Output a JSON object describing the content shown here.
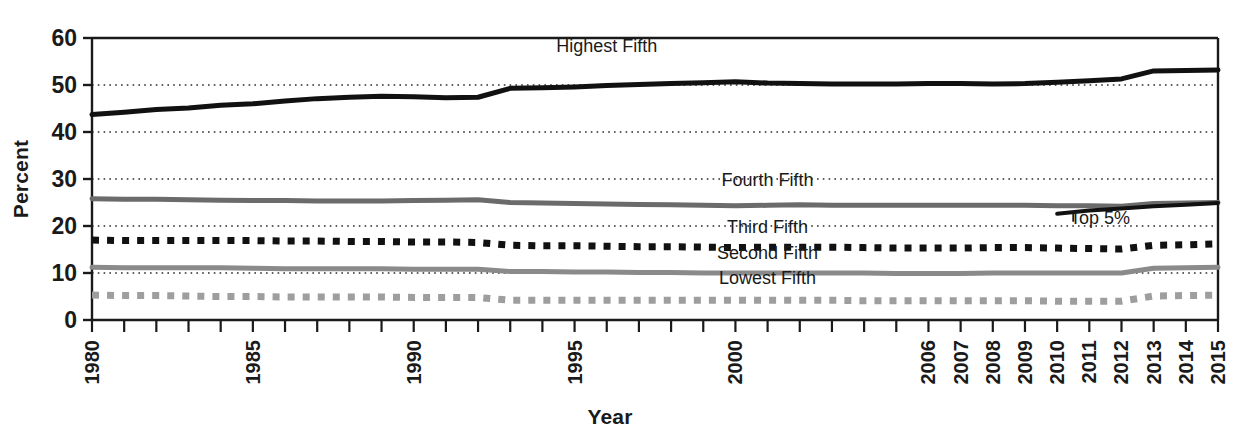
{
  "chart_data": {
    "type": "line",
    "title": "",
    "xlabel": "Year",
    "ylabel": "Percent",
    "ylim": [
      0,
      60
    ],
    "yticks": [
      0,
      10,
      20,
      30,
      40,
      50,
      60
    ],
    "grid": "horizontal-dotted",
    "legend_position": "inline-labels",
    "xlim": [
      1980,
      2015
    ],
    "xticks": [
      1980,
      1981,
      1982,
      1983,
      1984,
      1985,
      1986,
      1987,
      1988,
      1989,
      1990,
      1991,
      1992,
      1993,
      1994,
      1995,
      1996,
      1997,
      1998,
      1999,
      2000,
      2001,
      2002,
      2003,
      2004,
      2005,
      2006,
      2007,
      2008,
      2009,
      2010,
      2011,
      2012,
      2013,
      2014,
      2015
    ],
    "xticklabels": [
      "1980",
      "",
      "",
      "",
      "",
      "1985",
      "",
      "",
      "",
      "",
      "1990",
      "",
      "",
      "",
      "",
      "1995",
      "",
      "",
      "",
      "",
      "2000",
      "",
      "",
      "",
      "",
      "",
      "2006",
      "2007",
      "2008",
      "2009",
      "2010",
      "2011",
      "2012",
      "2013",
      "2014",
      "2015"
    ],
    "x": [
      1980,
      1981,
      1982,
      1983,
      1984,
      1985,
      1986,
      1987,
      1988,
      1989,
      1990,
      1991,
      1992,
      1993,
      1994,
      1995,
      1996,
      1997,
      1998,
      1999,
      2000,
      2001,
      2002,
      2003,
      2004,
      2005,
      2006,
      2007,
      2008,
      2009,
      2010,
      2011,
      2012,
      2013,
      2014,
      2015
    ],
    "series": [
      {
        "name": "Highest Fifth",
        "style": "solid",
        "color": "#111111",
        "width": 5,
        "label_x": 1996,
        "label_y": 57,
        "values": [
          43.7,
          44.2,
          44.8,
          45.1,
          45.7,
          46.0,
          46.6,
          47.1,
          47.4,
          47.6,
          47.5,
          47.3,
          47.4,
          49.3,
          49.4,
          49.6,
          49.9,
          50.1,
          50.3,
          50.5,
          50.7,
          50.4,
          50.3,
          50.2,
          50.2,
          50.2,
          50.3,
          50.3,
          50.2,
          50.3,
          50.6,
          50.9,
          51.3,
          53.0,
          53.1,
          53.2
        ]
      },
      {
        "name": "Fourth Fifth",
        "style": "solid",
        "color": "#6b6b6b",
        "width": 5,
        "label_x": 2001,
        "label_y": 28.5,
        "values": [
          25.8,
          25.7,
          25.7,
          25.6,
          25.5,
          25.4,
          25.4,
          25.3,
          25.3,
          25.3,
          25.4,
          25.5,
          25.6,
          25.0,
          24.9,
          24.8,
          24.7,
          24.6,
          24.5,
          24.4,
          24.3,
          24.4,
          24.5,
          24.4,
          24.4,
          24.4,
          24.4,
          24.4,
          24.4,
          24.4,
          24.3,
          24.3,
          24.2,
          24.8,
          24.9,
          25.0
        ]
      },
      {
        "name": "Top 5%",
        "style": "solid",
        "color": "#111111",
        "width": 4,
        "label_x": 2010.4,
        "label_y": 20.4,
        "start_year": 2010,
        "values": [
          null,
          null,
          null,
          null,
          null,
          null,
          null,
          null,
          null,
          null,
          null,
          null,
          null,
          null,
          null,
          null,
          null,
          null,
          null,
          null,
          null,
          null,
          null,
          null,
          null,
          null,
          null,
          null,
          null,
          null,
          22.6,
          23.3,
          23.7,
          24.2,
          24.5,
          24.9
        ]
      },
      {
        "name": "Third Fifth",
        "style": "dashed",
        "color": "#111111",
        "width": 7,
        "label_x": 2001,
        "label_y": 18.6,
        "values": [
          17.0,
          16.9,
          16.9,
          16.9,
          16.9,
          16.9,
          16.8,
          16.8,
          16.7,
          16.7,
          16.6,
          16.6,
          16.5,
          15.9,
          15.8,
          15.8,
          15.7,
          15.6,
          15.6,
          15.5,
          15.4,
          15.5,
          15.5,
          15.5,
          15.4,
          15.3,
          15.3,
          15.3,
          15.4,
          15.4,
          15.3,
          15.2,
          15.1,
          15.9,
          16.0,
          16.2
        ]
      },
      {
        "name": "Second Fifth",
        "style": "solid",
        "color": "#8a8a8a",
        "width": 5,
        "label_x": 2001,
        "label_y": 13.0,
        "values": [
          11.2,
          11.1,
          11.1,
          11.1,
          11.1,
          11.0,
          10.9,
          10.9,
          10.9,
          10.9,
          10.8,
          10.8,
          10.8,
          10.3,
          10.3,
          10.2,
          10.2,
          10.1,
          10.1,
          10.0,
          10.0,
          10.0,
          10.0,
          10.0,
          10.0,
          9.9,
          9.9,
          9.9,
          10.0,
          10.0,
          10.0,
          10.0,
          10.0,
          11.0,
          11.1,
          11.2
        ]
      },
      {
        "name": "Lowest Fifth",
        "style": "dashed",
        "color": "#9e9e9e",
        "width": 7,
        "label_x": 2001,
        "label_y": 7.6,
        "values": [
          5.3,
          5.2,
          5.2,
          5.1,
          5.0,
          5.0,
          4.9,
          4.9,
          4.9,
          4.9,
          4.8,
          4.8,
          4.8,
          4.2,
          4.2,
          4.2,
          4.2,
          4.2,
          4.2,
          4.2,
          4.2,
          4.2,
          4.2,
          4.2,
          4.1,
          4.1,
          4.1,
          4.1,
          4.1,
          4.1,
          4.0,
          4.0,
          4.0,
          5.1,
          5.2,
          5.3
        ]
      }
    ],
    "annotations": [
      {
        "name": "top5-leader",
        "x": 2010.5,
        "y_top": 22.8,
        "y_bottom": 20.9
      }
    ]
  },
  "axes": {
    "ylabel": "Percent",
    "xlabel": "Year",
    "ytick_labels": [
      "0",
      "10",
      "20",
      "30",
      "40",
      "50",
      "60"
    ]
  },
  "series_labels": [
    {
      "name": "highest-fifth-label",
      "text": "Highest Fifth"
    },
    {
      "name": "fourth-fifth-label",
      "text": "Fourth Fifth"
    },
    {
      "name": "third-fifth-label",
      "text": "Third Fifth"
    },
    {
      "name": "second-fifth-label",
      "text": "Second Fifth"
    },
    {
      "name": "lowest-fifth-label",
      "text": "Lowest Fifth"
    },
    {
      "name": "top-5-percent-label",
      "text": "Top 5%"
    }
  ]
}
